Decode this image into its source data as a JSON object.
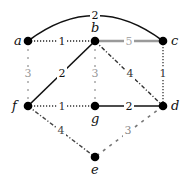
{
  "diagram": {
    "type": "weighted-graph",
    "nodes": [
      {
        "id": "a",
        "label": "a",
        "x": 28,
        "y": 41,
        "label_x": 14,
        "label_y": 45
      },
      {
        "id": "b",
        "label": "b",
        "x": 95,
        "y": 41,
        "label_x": 91,
        "label_y": 32
      },
      {
        "id": "c",
        "label": "c",
        "x": 163,
        "y": 41,
        "label_x": 171,
        "label_y": 45
      },
      {
        "id": "f",
        "label": "f",
        "x": 28,
        "y": 106,
        "label_x": 12,
        "label_y": 110
      },
      {
        "id": "g",
        "label": "g",
        "x": 95,
        "y": 106,
        "label_x": 91,
        "label_y": 123
      },
      {
        "id": "d",
        "label": "d",
        "x": 163,
        "y": 106,
        "label_x": 171,
        "label_y": 110
      },
      {
        "id": "e",
        "label": "e",
        "x": 95,
        "y": 157,
        "label_x": 91,
        "label_y": 174
      }
    ],
    "edges": [
      {
        "from": "a",
        "to": "c",
        "weight": "2",
        "style": "solid-arc",
        "color": "#111111",
        "label_color": "#111111",
        "label_x": 95,
        "label_y": 19
      },
      {
        "from": "a",
        "to": "b",
        "weight": "1",
        "style": "dotted",
        "color": "#222222",
        "label_color": "#222222",
        "label_x": 62,
        "label_y": 45
      },
      {
        "from": "b",
        "to": "c",
        "weight": "5",
        "style": "solid-thick",
        "color": "#9a9a9a",
        "label_color": "#aaaaaa",
        "label_x": 129,
        "label_y": 45
      },
      {
        "from": "a",
        "to": "f",
        "weight": "3",
        "style": "sparse-dashed",
        "color": "#999999",
        "label_color": "#999999",
        "label_x": 28,
        "label_y": 77
      },
      {
        "from": "b",
        "to": "g",
        "weight": "3",
        "style": "sparse-dashed",
        "color": "#999999",
        "label_color": "#999999",
        "label_x": 95,
        "label_y": 77
      },
      {
        "from": "f",
        "to": "b",
        "weight": "2",
        "style": "solid",
        "color": "#111111",
        "label_color": "#111111",
        "label_x": 62,
        "label_y": 77
      },
      {
        "from": "b",
        "to": "d",
        "weight": "4",
        "style": "dash-dot",
        "color": "#333333",
        "label_color": "#333333",
        "label_x": 130,
        "label_y": 77
      },
      {
        "from": "c",
        "to": "d",
        "weight": "1",
        "style": "dotted",
        "color": "#333333",
        "label_color": "#333333",
        "label_x": 163,
        "label_y": 77
      },
      {
        "from": "f",
        "to": "g",
        "weight": "1",
        "style": "dotted",
        "color": "#333333",
        "label_color": "#333333",
        "label_x": 62,
        "label_y": 110
      },
      {
        "from": "g",
        "to": "d",
        "weight": "2",
        "style": "solid",
        "color": "#111111",
        "label_color": "#111111",
        "label_x": 129,
        "label_y": 110
      },
      {
        "from": "f",
        "to": "e",
        "weight": "4",
        "style": "dash-dot",
        "color": "#444444",
        "label_color": "#444444",
        "label_x": 61,
        "label_y": 134
      },
      {
        "from": "d",
        "to": "e",
        "weight": "3",
        "style": "dashed",
        "color": "#777777",
        "label_color": "#888888",
        "label_x": 128,
        "label_y": 134
      }
    ]
  }
}
